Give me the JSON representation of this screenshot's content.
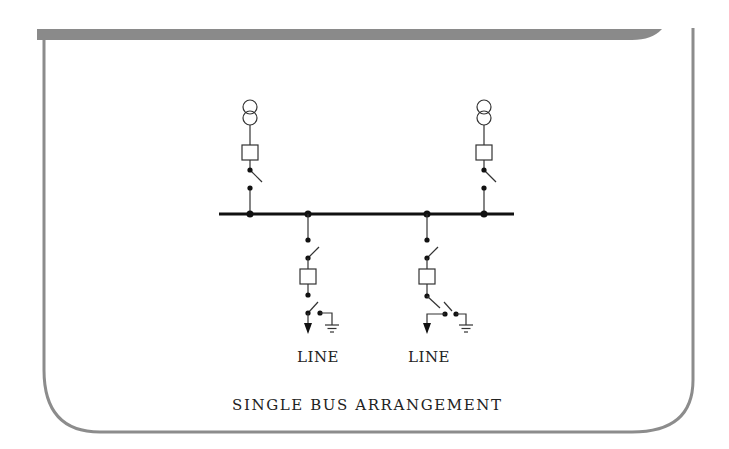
{
  "diagram": {
    "title": "SINGLE BUS ARRANGEMENT",
    "colors": {
      "frame": "#8c8c8c",
      "ink": "#1a1a1a",
      "background": "#ffffff"
    },
    "bus": {
      "label": "",
      "x1": 219,
      "x2": 514,
      "y": 214
    },
    "sources": [
      {
        "id": "transformer-1",
        "x": 250,
        "type": "transformer",
        "components": [
          "transformer",
          "circuit-breaker",
          "disconnect-switch"
        ]
      },
      {
        "id": "transformer-2",
        "x": 484,
        "type": "transformer",
        "components": [
          "transformer",
          "circuit-breaker",
          "disconnect-switch"
        ]
      }
    ],
    "feeders": [
      {
        "id": "feeder-1",
        "x": 308,
        "label": "LINE",
        "components": [
          "disconnect-switch",
          "circuit-breaker",
          "disconnect-switch",
          "earthing-switch",
          "line-arrow"
        ]
      },
      {
        "id": "feeder-2",
        "x": 427,
        "label": "LINE",
        "components": [
          "disconnect-switch",
          "circuit-breaker",
          "disconnect-switch",
          "earthing-switch",
          "line-arrow"
        ]
      }
    ]
  }
}
